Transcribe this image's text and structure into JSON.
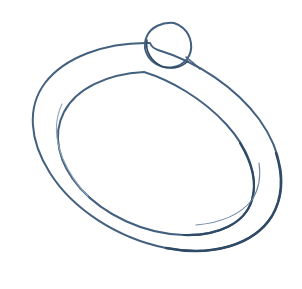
{
  "canvas": {
    "width": 302,
    "height": 289,
    "background_color": "#ffffff",
    "title": "Hand-drawn ring sketch"
  },
  "drawing": {
    "medium": "pen-ink-sketch",
    "subject": "ring",
    "ink_color": "#44607f",
    "ink_color_dark": "#2f4a66",
    "ink_color_light": "#8fa6bd",
    "stroke_width_outer": 2.0,
    "stroke_width_inner": 2.0,
    "stroke_width_accent": 1.1,
    "strokes": [
      {
        "name": "outer-band-outline",
        "role": "outer ellipse forming the outside edge of the ring band",
        "color": "#44607f",
        "width": 2.0,
        "path": "M 150 43 C 104 42 64 58 45 83 C 27 107 29 140 50 173 C 72 208 116 238 166 248 C 212 257 254 245 272 216 C 289 188 282 151 259 119 C 236 88 198 62 158 50 C 155 49 152 48 150 43 Z"
      },
      {
        "name": "outer-band-outline-highlight",
        "role": "darker pressure pass on lower-right of outer edge",
        "color": "#2f4a66",
        "width": 2.4,
        "path": "M 166 248 C 212 257 254 245 272 216 C 283 197 283 175 276 153"
      },
      {
        "name": "inner-hole-outline",
        "role": "inner ellipse forming the hole of the ring",
        "color": "#44607f",
        "width": 2.0,
        "path": "M 144 72 C 106 74 76 89 64 112 C 52 135 58 163 80 188 C 104 215 144 234 184 235 C 219 236 245 223 252 200 C 259 176 248 148 226 124 C 202 98 170 80 144 72 Z"
      },
      {
        "name": "inner-hole-outline-highlight",
        "role": "darker pressure pass on lower-right of inner hole",
        "color": "#2f4a66",
        "width": 2.2,
        "path": "M 184 235 C 219 236 245 223 252 200 C 257 183 252 163 240 143"
      },
      {
        "name": "band-inner-accent-left",
        "role": "short light secondary contour inside the left band",
        "color": "#8fa6bd",
        "width": 1.1,
        "path": "M 62 104 C 54 121 55 140 63 159 C 69 173 78 186 88 196"
      },
      {
        "name": "band-inner-accent-bottom-right",
        "role": "short light secondary contour inside the lower-right band",
        "color": "#6d87a4",
        "width": 1.1,
        "path": "M 196 225 C 219 223 240 215 252 200 C 259 189 261 176 259 163"
      },
      {
        "name": "gem-bead-circle",
        "role": "small circle at top of ring representing the gem or bead",
        "color": "#44607f",
        "width": 2.0,
        "path": "M 174 23 C 162 22 151 27 147 36 C 142 46 146 58 156 64 C 166 70 180 68 187 59 C 194 50 192 36 183 28 C 180 25 177 24 174 23 Z"
      },
      {
        "name": "gem-bead-circle-highlight",
        "role": "darker pressure pass on the gem circle lower-left",
        "color": "#2f4a66",
        "width": 1.6,
        "path": "M 147 40 C 145 51 151 61 161 66 C 170 70 181 68 188 61"
      },
      {
        "name": "gem-to-band-joint-right",
        "role": "short stroke joining the gem to the outer band on the right",
        "color": "#44607f",
        "width": 1.6,
        "path": "M 186 57 C 191 61 196 65 200 69"
      }
    ]
  }
}
